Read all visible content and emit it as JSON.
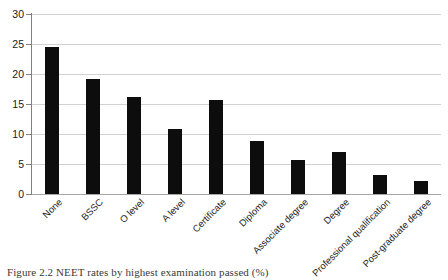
{
  "figure": {
    "caption": "Figure 2.2  NEET rates by highest examination passed (%)"
  },
  "chart_data": {
    "type": "bar",
    "title": "",
    "xlabel": "",
    "ylabel": "",
    "ylim": [
      0,
      30
    ],
    "yticks": [
      0,
      5,
      10,
      15,
      20,
      25,
      30
    ],
    "ytick_labels": [
      "0",
      "5",
      "10",
      "15",
      "20",
      "25",
      "30"
    ],
    "grid": true,
    "legend": "none",
    "bar_color": "#0d0d0d",
    "categories": [
      "None",
      "BSSC",
      "O level",
      "A level",
      "Certificate",
      "Diploma",
      "Associate degree",
      "Degree",
      "Professional qualification",
      "Post-graduate degree"
    ],
    "values": [
      24.5,
      19.1,
      16.1,
      10.8,
      15.7,
      8.9,
      5.7,
      7.0,
      3.2,
      2.2
    ]
  }
}
